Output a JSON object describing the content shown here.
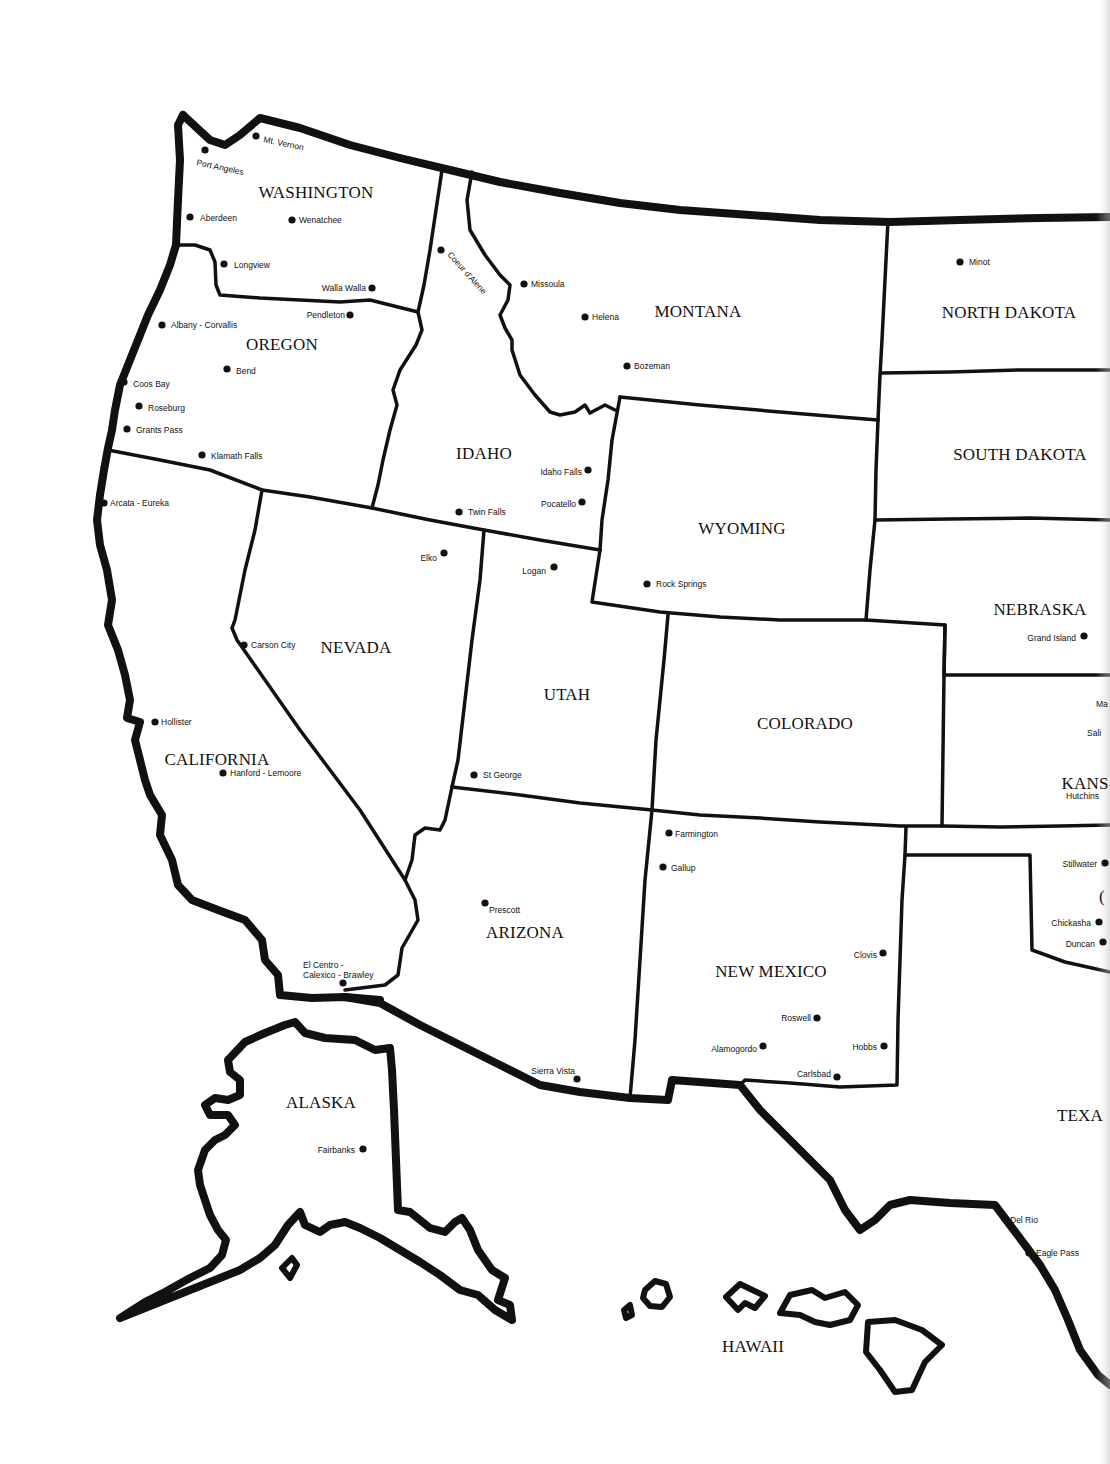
{
  "map": {
    "title": "Western United States",
    "colors": {
      "ink": "#111111",
      "paper": "#ffffff"
    },
    "states": [
      {
        "id": "washington",
        "label": "WASHINGTON",
        "x": 316,
        "y": 198
      },
      {
        "id": "oregon",
        "label": "OREGON",
        "x": 282,
        "y": 350
      },
      {
        "id": "montana",
        "label": "MONTANA",
        "x": 698,
        "y": 317
      },
      {
        "id": "north-dakota",
        "label": "NORTH DAKOTA",
        "x": 1009,
        "y": 318
      },
      {
        "id": "south-dakota",
        "label": "SOUTH DAKOTA",
        "x": 1020,
        "y": 460
      },
      {
        "id": "idaho",
        "label": "IDAHO",
        "x": 484,
        "y": 459
      },
      {
        "id": "wyoming",
        "label": "WYOMING",
        "x": 742,
        "y": 534
      },
      {
        "id": "nebraska",
        "label": "NEBRASKA",
        "x": 1040,
        "y": 615
      },
      {
        "id": "nevada",
        "label": "NEVADA",
        "x": 356,
        "y": 653
      },
      {
        "id": "utah",
        "label": "UTAH",
        "x": 567,
        "y": 700
      },
      {
        "id": "colorado",
        "label": "COLORADO",
        "x": 805,
        "y": 729
      },
      {
        "id": "kansas",
        "label": "KANS",
        "x": 1085,
        "y": 789
      },
      {
        "id": "california",
        "label": "CALIFORNIA",
        "x": 217,
        "y": 765
      },
      {
        "id": "arizona",
        "label": "ARIZONA",
        "x": 525,
        "y": 938
      },
      {
        "id": "new-mexico",
        "label": "NEW MEXICO",
        "x": 771,
        "y": 977
      },
      {
        "id": "oklahoma",
        "label": "(",
        "x": 1102,
        "y": 902
      },
      {
        "id": "texas",
        "label": "TEXA",
        "x": 1080,
        "y": 1121
      },
      {
        "id": "alaska",
        "label": "ALASKA",
        "x": 321,
        "y": 1108
      },
      {
        "id": "hawaii",
        "label": "HAWAII",
        "x": 753,
        "y": 1352
      }
    ],
    "cities": [
      {
        "name": "Mt. Vernon",
        "x": 256,
        "y": 136,
        "lx": 263,
        "ly": 142,
        "anchor": "start",
        "rotate": 12
      },
      {
        "name": "Port Angeles",
        "x": 205,
        "y": 150,
        "lx": 196,
        "ly": 165,
        "anchor": "start",
        "rotate": 12
      },
      {
        "name": "Aberdeen",
        "x": 190,
        "y": 217,
        "lx": 200,
        "ly": 221,
        "anchor": "start",
        "rotate": 0
      },
      {
        "name": "Wenatchee",
        "x": 292,
        "y": 220,
        "lx": 299,
        "ly": 223,
        "anchor": "start",
        "rotate": 0
      },
      {
        "name": "Longview",
        "x": 224,
        "y": 264,
        "lx": 234,
        "ly": 268,
        "anchor": "start",
        "rotate": 0
      },
      {
        "name": "Walla Walla",
        "x": 372,
        "y": 288,
        "lx": 366,
        "ly": 291,
        "anchor": "end",
        "rotate": 0
      },
      {
        "name": "Pendleton",
        "x": 350,
        "y": 315,
        "lx": 345,
        "ly": 318,
        "anchor": "end",
        "rotate": 0
      },
      {
        "name": "Albany - Corvallis",
        "x": 162,
        "y": 325,
        "lx": 171,
        "ly": 328,
        "anchor": "start",
        "rotate": 0
      },
      {
        "name": "Bend",
        "x": 227,
        "y": 369,
        "lx": 236,
        "ly": 374,
        "anchor": "start",
        "rotate": 0
      },
      {
        "name": "Coos Bay",
        "x": 124,
        "y": 382,
        "lx": 133,
        "ly": 387,
        "anchor": "start",
        "rotate": 0
      },
      {
        "name": "Roseburg",
        "x": 139,
        "y": 406,
        "lx": 148,
        "ly": 411,
        "anchor": "start",
        "rotate": 0
      },
      {
        "name": "Grants Pass",
        "x": 127,
        "y": 429,
        "lx": 136,
        "ly": 433,
        "anchor": "start",
        "rotate": 0
      },
      {
        "name": "Klamath Falls",
        "x": 202,
        "y": 455,
        "lx": 211,
        "ly": 459,
        "anchor": "start",
        "rotate": 0
      },
      {
        "name": "Arcata - Eureka",
        "x": 104,
        "y": 503,
        "lx": 110,
        "ly": 506,
        "anchor": "start",
        "rotate": 0
      },
      {
        "name": "Coeur d'Alene",
        "x": 441,
        "y": 250,
        "lx": 447,
        "ly": 255,
        "anchor": "start",
        "rotate": 48
      },
      {
        "name": "Missoula",
        "x": 524,
        "y": 284,
        "lx": 531,
        "ly": 287,
        "anchor": "start",
        "rotate": 0
      },
      {
        "name": "Helena",
        "x": 585,
        "y": 317,
        "lx": 592,
        "ly": 320,
        "anchor": "start",
        "rotate": 0
      },
      {
        "name": "Bozeman",
        "x": 627,
        "y": 366,
        "lx": 634,
        "ly": 369,
        "anchor": "start",
        "rotate": 0
      },
      {
        "name": "Minot",
        "x": 960,
        "y": 262,
        "lx": 969,
        "ly": 265,
        "anchor": "start",
        "rotate": 0
      },
      {
        "name": "Idaho Falls",
        "x": 588,
        "y": 470,
        "lx": 582,
        "ly": 475,
        "anchor": "end",
        "rotate": 0
      },
      {
        "name": "Pocatello",
        "x": 582,
        "y": 502,
        "lx": 576,
        "ly": 507,
        "anchor": "end",
        "rotate": 0
      },
      {
        "name": "Twin Falls",
        "x": 459,
        "y": 512,
        "lx": 468,
        "ly": 515,
        "anchor": "start",
        "rotate": 0
      },
      {
        "name": "Elko",
        "x": 444,
        "y": 553,
        "lx": 437,
        "ly": 561,
        "anchor": "end",
        "rotate": 0
      },
      {
        "name": "Logan",
        "x": 554,
        "y": 567,
        "lx": 546,
        "ly": 574,
        "anchor": "end",
        "rotate": 0
      },
      {
        "name": "Rock Springs",
        "x": 647,
        "y": 584,
        "lx": 656,
        "ly": 587,
        "anchor": "start",
        "rotate": 0
      },
      {
        "name": "Grand Island",
        "x": 1084,
        "y": 636,
        "lx": 1076,
        "ly": 641,
        "anchor": "end",
        "rotate": 0
      },
      {
        "name": "Carson City",
        "x": 244,
        "y": 645,
        "lx": 251,
        "ly": 648,
        "anchor": "start",
        "rotate": 0
      },
      {
        "name": "Hollister",
        "x": 155,
        "y": 722,
        "lx": 161,
        "ly": 725,
        "anchor": "start",
        "rotate": 0
      },
      {
        "name": "Hanford - Lemoore",
        "x": 223,
        "y": 773,
        "lx": 230,
        "ly": 776,
        "anchor": "start",
        "rotate": 0
      },
      {
        "name": "St George",
        "x": 474,
        "y": 775,
        "lx": 483,
        "ly": 778,
        "anchor": "start",
        "rotate": 0
      },
      {
        "name": "Ma",
        "x": 1110,
        "y": 702,
        "lx": 1096,
        "ly": 707,
        "anchor": "start",
        "rotate": 0
      },
      {
        "name": "Sali",
        "x": 1110,
        "y": 731,
        "lx": 1087,
        "ly": 736,
        "anchor": "start",
        "rotate": 0
      },
      {
        "name": "Hutchins",
        "x": 1110,
        "y": 794,
        "lx": 1066,
        "ly": 799,
        "anchor": "start",
        "rotate": 0
      },
      {
        "name": "Farmington",
        "x": 669,
        "y": 833,
        "lx": 675,
        "ly": 837,
        "anchor": "start",
        "rotate": 0
      },
      {
        "name": "Gallup",
        "x": 663,
        "y": 867,
        "lx": 671,
        "ly": 871,
        "anchor": "start",
        "rotate": 0
      },
      {
        "name": "Stillwater",
        "x": 1105,
        "y": 863,
        "lx": 1097,
        "ly": 867,
        "anchor": "end",
        "rotate": 0
      },
      {
        "name": "Chickasha",
        "x": 1099,
        "y": 922,
        "lx": 1091,
        "ly": 926,
        "anchor": "end",
        "rotate": 0
      },
      {
        "name": "Duncan",
        "x": 1103,
        "y": 942,
        "lx": 1095,
        "ly": 947,
        "anchor": "end",
        "rotate": 0
      },
      {
        "name": "Prescott",
        "x": 485,
        "y": 903,
        "lx": 489,
        "ly": 913,
        "anchor": "start",
        "rotate": 0
      },
      {
        "name": "Clovis",
        "x": 883,
        "y": 953,
        "lx": 877,
        "ly": 958,
        "anchor": "end",
        "rotate": 0
      },
      {
        "name": "Roswell",
        "x": 817,
        "y": 1018,
        "lx": 811,
        "ly": 1021,
        "anchor": "end",
        "rotate": 0
      },
      {
        "name": "Alamogordo",
        "x": 763,
        "y": 1046,
        "lx": 757,
        "ly": 1052,
        "anchor": "end",
        "rotate": 0
      },
      {
        "name": "Hobbs",
        "x": 884,
        "y": 1046,
        "lx": 877,
        "ly": 1050,
        "anchor": "end",
        "rotate": 0
      },
      {
        "name": "Carlsbad",
        "x": 837,
        "y": 1077,
        "lx": 831,
        "ly": 1077,
        "anchor": "end",
        "rotate": 0
      },
      {
        "name": "Sierra Vista",
        "x": 577,
        "y": 1079,
        "lx": 575,
        "ly": 1074,
        "anchor": "end",
        "rotate": 0
      },
      {
        "name": "Fairbanks",
        "x": 363,
        "y": 1149,
        "lx": 355,
        "ly": 1153,
        "anchor": "end",
        "rotate": 0
      },
      {
        "name": "Del Rio",
        "x": 1005,
        "y": 1219,
        "lx": 1010,
        "ly": 1223,
        "anchor": "start",
        "rotate": 0
      },
      {
        "name": "Eagle Pass",
        "x": 1029,
        "y": 1253,
        "lx": 1036,
        "ly": 1256,
        "anchor": "start",
        "rotate": 0
      }
    ],
    "multiline_cities": [
      {
        "name": "El Centro - Calexico - Brawley",
        "lines": [
          "El Centro -",
          "Calexico - Brawley"
        ],
        "x": 343,
        "y": 983,
        "lx": 303,
        "ly": 968
      }
    ]
  }
}
